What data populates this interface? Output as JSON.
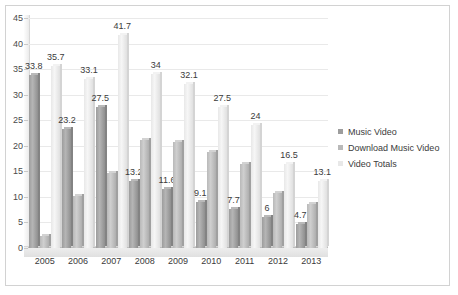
{
  "chart_data": {
    "type": "bar",
    "title": "",
    "xlabel": "",
    "ylabel": "",
    "ylim": [
      0,
      45
    ],
    "yticks": [
      0,
      5,
      10,
      15,
      20,
      25,
      30,
      35,
      40,
      45
    ],
    "grid": true,
    "legend_position": "right",
    "categories": [
      "2005",
      "2006",
      "2007",
      "2008",
      "2009",
      "2010",
      "2011",
      "2012",
      "2013"
    ],
    "series": [
      {
        "name": "Music Video",
        "color": "#9d9d9d",
        "values": [
          33.8,
          23.2,
          27.5,
          13.2,
          11.6,
          9.1,
          7.7,
          6,
          4.7
        ],
        "labels": [
          "33.8",
          "23.2",
          "27.5",
          "13.2",
          "11.6",
          "9.1",
          "7.7",
          "6",
          "4.7"
        ]
      },
      {
        "name": "Download Music Video",
        "color": "#b9b9b9",
        "values": [
          2.3,
          10.2,
          14.6,
          21.2,
          20.8,
          18.8,
          16.4,
          10.8,
          8.6
        ],
        "labels": [
          "",
          "",
          "",
          "",
          "",
          "",
          "",
          "",
          ""
        ]
      },
      {
        "name": "Video Totals",
        "color": "#e8e8e8",
        "values": [
          35.7,
          33.1,
          41.7,
          34,
          32.1,
          27.5,
          24,
          16.5,
          13.1
        ],
        "labels": [
          "35.7",
          "33.1",
          "41.7",
          "34",
          "32.1",
          "27.5",
          "24",
          "16.5",
          "13.1"
        ]
      }
    ]
  }
}
